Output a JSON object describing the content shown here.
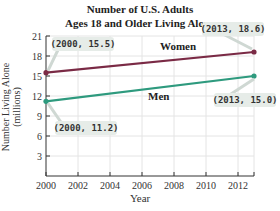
{
  "chart_data": {
    "type": "line",
    "title": "Number of U.S. Adults",
    "subtitle": "Ages 18 and Older Living Alone",
    "xlabel": "Year",
    "ylabel": "Number Living Alone",
    "ylabel_units": "(millions)",
    "x_ticks": [
      "2000",
      "2002",
      "2004",
      "2006",
      "2008",
      "2010",
      "2012"
    ],
    "y_ticks": [
      "3",
      "6",
      "9",
      "12",
      "15",
      "18",
      "21"
    ],
    "xlim": [
      2000,
      2013
    ],
    "ylim": [
      0,
      21
    ],
    "grid": true,
    "legend": "inline labels",
    "series": [
      {
        "name": "Women",
        "color": "#7a2a45",
        "x": [
          2000,
          2013
        ],
        "values": [
          15.5,
          18.6
        ],
        "annotations": [
          "(2000, 15.5)",
          "(2013, 18.6)"
        ]
      },
      {
        "name": "Men",
        "color": "#2e9a7e",
        "x": [
          2000,
          2013
        ],
        "values": [
          11.2,
          15.0
        ],
        "annotations": [
          "(2000, 11.2)",
          "(2013, 15.0)"
        ]
      }
    ]
  }
}
